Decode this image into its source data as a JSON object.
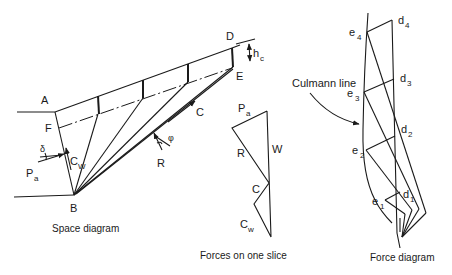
{
  "space_diagram": {
    "caption": "Space diagram",
    "points": {
      "A": "A",
      "B": "B",
      "D": "D",
      "E": "E",
      "F": "F"
    },
    "forces": {
      "Pa": "P",
      "Pa_sub": "a",
      "Cw": "C",
      "Cw_sub": "W",
      "R": "R",
      "C": "C"
    },
    "angles": {
      "delta": "δ",
      "phi": "φ"
    },
    "dimension": {
      "h": "h",
      "h_sub": "c"
    }
  },
  "slice_forces": {
    "caption": "Forces on one slice",
    "labels": {
      "Pa": "P",
      "Pa_sub": "a",
      "W": "W",
      "R": "R",
      "C": "C",
      "Cw": "C",
      "Cw_sub": "w"
    }
  },
  "force_diagram": {
    "caption": "Force diagram",
    "culmann_label": "Culmann line",
    "e_points": [
      {
        "base": "e",
        "sub": "1"
      },
      {
        "base": "e",
        "sub": "2"
      },
      {
        "base": "e",
        "sub": "3"
      },
      {
        "base": "e",
        "sub": "4"
      }
    ],
    "d_points": [
      {
        "base": "d",
        "sub": "1"
      },
      {
        "base": "d",
        "sub": "2"
      },
      {
        "base": "d",
        "sub": "3"
      },
      {
        "base": "d",
        "sub": "4"
      }
    ]
  }
}
